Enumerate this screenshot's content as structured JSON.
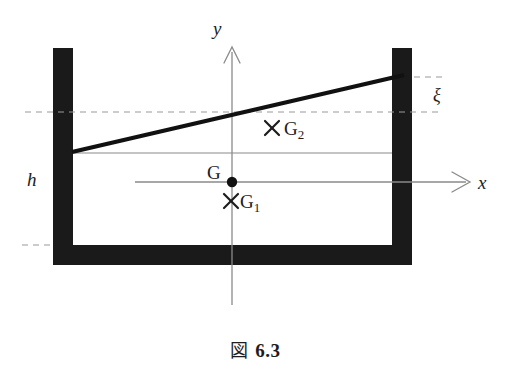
{
  "figure": {
    "caption_symbol": "図",
    "caption_number": "6.3",
    "caption_full": "図 6.3",
    "axes": {
      "y_axis_label": "y",
      "x_axis_label": "x",
      "origin_label": "G"
    },
    "points": [
      {
        "id": "G",
        "label": "G",
        "marker": "filled-dot",
        "x": 232,
        "y": 182
      },
      {
        "id": "G1",
        "label": "G",
        "subscript": "1",
        "marker": "cross",
        "x": 231,
        "y": 201
      },
      {
        "id": "G2",
        "label": "G",
        "subscript": "2",
        "marker": "cross",
        "x": 272,
        "y": 128
      }
    ],
    "dimensions": [
      {
        "id": "h",
        "label": "h"
      },
      {
        "id": "xi",
        "label": "ξ"
      }
    ],
    "colors": {
      "wall": "#1a1a1a",
      "surface_line": "#111111",
      "axis": "#808080",
      "thin_line": "#8a8a8a",
      "dashed": "#9a9a9a",
      "text": "#1d1d1d",
      "background": "#ffffff"
    },
    "geometry": {
      "container_outer_left": 53,
      "container_outer_right": 412,
      "container_inner_left": 73,
      "container_inner_right": 392,
      "container_top": 48,
      "container_floor_inner": 245,
      "container_bottom": 265,
      "wall_thickness": 20,
      "rest_level_y": 153,
      "tilted_surface_left_y": 152,
      "tilted_surface_right_y": 78,
      "dashed_level_y": 112,
      "dashed_top_y": 77,
      "dashed_bottom_y": 245,
      "origin_x": 232,
      "origin_y": 182,
      "x_axis_end": 470,
      "y_axis_top": 48,
      "y_axis_bottom": 305
    }
  }
}
